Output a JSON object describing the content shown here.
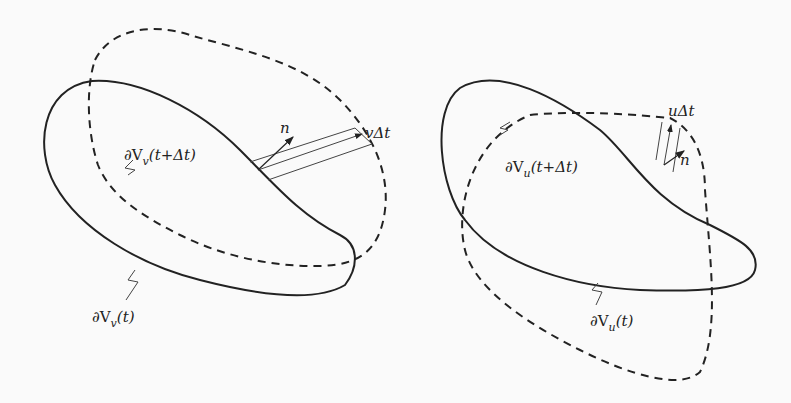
{
  "left_panel": {
    "boundary_t": "∂V",
    "boundary_t_sub": "v",
    "boundary_t_arg": "(t)",
    "boundary_tdt": "∂V",
    "boundary_tdt_sub": "v",
    "boundary_tdt_arg": "(t+Δt)",
    "normal": "n",
    "displacement": "vΔt"
  },
  "right_panel": {
    "boundary_t": "∂V",
    "boundary_t_sub": "u",
    "boundary_t_arg": "(t)",
    "boundary_tdt": "∂V",
    "boundary_tdt_sub": "u",
    "boundary_tdt_arg": "(t+Δt)",
    "normal": "n",
    "displacement": "uΔt"
  },
  "colors": {
    "stroke": "#222222",
    "background": "#fafafa"
  }
}
